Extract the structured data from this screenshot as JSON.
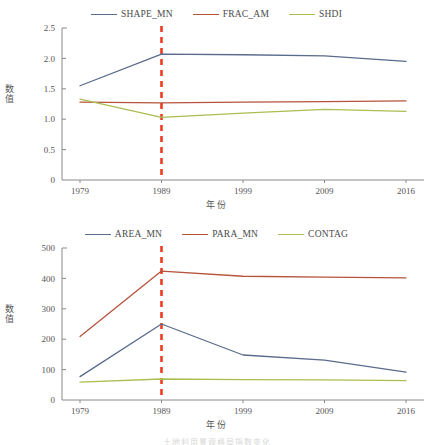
{
  "figure": {
    "caption_partial": "土地利用景观格局指数变化",
    "reference_line_color": "#ee3b24",
    "reference_line_year": "1989",
    "axis_color": "#8a8a8a",
    "background": "#ffffff"
  },
  "charts": [
    {
      "id": "chart-top",
      "ylabel": "数值",
      "xlabel": "年份",
      "ytick_labels": [
        "0",
        "0.5",
        "1.0",
        "1.5",
        "2.0",
        "2.5"
      ],
      "xtick_labels": [
        "1979",
        "1989",
        "1999",
        "2009",
        "2016"
      ],
      "legend": [
        {
          "label": "SHAPE_MN",
          "color": "#5a6b8c"
        },
        {
          "label": "FRAC_AM",
          "color": "#b5533c"
        },
        {
          "label": "SHDI",
          "color": "#a9bf52"
        }
      ]
    },
    {
      "id": "chart-bottom",
      "ylabel": "数值",
      "xlabel": "年份",
      "ytick_labels": [
        "0",
        "100",
        "200",
        "300",
        "400",
        "500"
      ],
      "xtick_labels": [
        "1979",
        "1989",
        "1999",
        "2009",
        "2016"
      ],
      "legend": [
        {
          "label": "AREA_MN",
          "color": "#5a6b8c"
        },
        {
          "label": "PARA_MN",
          "color": "#b5533c"
        },
        {
          "label": "CONTAG",
          "color": "#a9bf52"
        }
      ]
    }
  ],
  "chart_data": [
    {
      "type": "line",
      "title": "",
      "xlabel": "年份",
      "ylabel": "数值",
      "categories": [
        "1979",
        "1989",
        "1999",
        "2009",
        "2016"
      ],
      "x": [
        1979,
        1989,
        1999,
        2009,
        2016
      ],
      "ylim": [
        0,
        2.5
      ],
      "yticks": [
        0,
        0.5,
        1.0,
        1.5,
        2.0,
        2.5
      ],
      "grid": false,
      "legend_position": "top-center",
      "annotations": [
        {
          "type": "vertical-dashed-line",
          "x": 1989,
          "color": "#ee3b24"
        }
      ],
      "series": [
        {
          "name": "SHAPE_MN",
          "color": "#5a6b8c",
          "values": [
            1.55,
            2.07,
            2.06,
            2.04,
            1.95
          ]
        },
        {
          "name": "FRAC_AM",
          "color": "#b5533c",
          "values": [
            1.28,
            1.27,
            1.28,
            1.29,
            1.3
          ]
        },
        {
          "name": "SHDI",
          "color": "#a9bf52",
          "values": [
            1.33,
            1.03,
            1.1,
            1.16,
            1.13
          ]
        }
      ]
    },
    {
      "type": "line",
      "title": "",
      "xlabel": "年份",
      "ylabel": "数值",
      "categories": [
        "1979",
        "1989",
        "1999",
        "2009",
        "2016"
      ],
      "x": [
        1979,
        1989,
        1999,
        2009,
        2016
      ],
      "ylim": [
        0,
        500
      ],
      "yticks": [
        0,
        100,
        200,
        300,
        400,
        500
      ],
      "grid": false,
      "legend_position": "top-center",
      "annotations": [
        {
          "type": "vertical-dashed-line",
          "x": 1989,
          "color": "#ee3b24"
        }
      ],
      "series": [
        {
          "name": "AREA_MN",
          "color": "#5a6b8c",
          "values": [
            77,
            250,
            148,
            131,
            92
          ]
        },
        {
          "name": "PARA_MN",
          "color": "#b5533c",
          "values": [
            209,
            424,
            407,
            404,
            402
          ]
        },
        {
          "name": "CONTAG",
          "color": "#a9bf52",
          "values": [
            59,
            69,
            67,
            66,
            64
          ]
        }
      ]
    }
  ]
}
